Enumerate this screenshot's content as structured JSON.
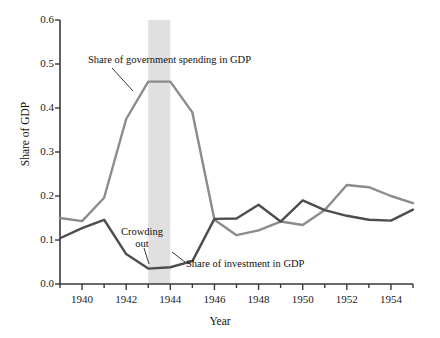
{
  "chart_data": {
    "type": "line",
    "title": "",
    "xlabel": "Year",
    "ylabel": "Share of GDP",
    "xlim": [
      1939,
      1955
    ],
    "ylim": [
      0.0,
      0.6
    ],
    "grid": false,
    "legend_position": "inline-annotations",
    "x": [
      1939,
      1940,
      1941,
      1942,
      1943,
      1944,
      1945,
      1946,
      1947,
      1948,
      1949,
      1950,
      1951,
      1952,
      1953,
      1954,
      1955
    ],
    "xticks_major": [
      1940,
      1942,
      1944,
      1946,
      1948,
      1950,
      1952,
      1954
    ],
    "xtick_labels": [
      "1940",
      "1942",
      "1944",
      "1946",
      "1948",
      "1950",
      "1952",
      "1954"
    ],
    "yticks": [
      0.0,
      0.1,
      0.2,
      0.3,
      0.4,
      0.5,
      0.6
    ],
    "ytick_labels": [
      "0.0",
      "0.1",
      "0.2",
      "0.3",
      "0.4",
      "0.5",
      "0.6"
    ],
    "series": [
      {
        "name": "Share of government spending in GDP",
        "color": "#8c8c8c",
        "values": [
          0.15,
          0.143,
          0.196,
          0.375,
          0.46,
          0.46,
          0.39,
          0.146,
          0.111,
          0.122,
          0.142,
          0.134,
          0.168,
          0.225,
          0.22,
          0.2,
          0.184
        ]
      },
      {
        "name": "Share of investment in GDP",
        "color": "#4d4d4d",
        "values": [
          0.104,
          0.127,
          0.146,
          0.068,
          0.035,
          0.038,
          0.052,
          0.148,
          0.149,
          0.18,
          0.142,
          0.19,
          0.168,
          0.155,
          0.146,
          0.144,
          0.169
        ]
      }
    ],
    "shaded_band": {
      "label": "Crowding out",
      "x_start": 1943,
      "x_end": 1944,
      "color": "#e0e0e0"
    },
    "annotations": [
      {
        "name": "government-spending-label",
        "text": "Share of government spending in GDP"
      },
      {
        "name": "investment-label",
        "text": "Share of investment in GDP"
      },
      {
        "name": "crowding-out-label",
        "text": "Crowding out"
      }
    ]
  },
  "axes": {
    "y_title": "Share of GDP",
    "x_title": "Year"
  },
  "labels": {
    "y": [
      "0.6",
      "0.5",
      "0.4",
      "0.3",
      "0.2",
      "0.1",
      "0.0"
    ],
    "x": [
      "1940",
      "1942",
      "1944",
      "1946",
      "1948",
      "1950",
      "1952",
      "1954"
    ]
  },
  "annotations": {
    "government": "Share of government spending in GDP",
    "investment": "Share of investment in GDP",
    "crowding_out": "Crowding out"
  },
  "colors": {
    "government_line": "#8c8c8c",
    "investment_line": "#4d4d4d",
    "band": "#e0e0e0",
    "axis": "#3a3a3a"
  }
}
